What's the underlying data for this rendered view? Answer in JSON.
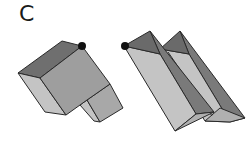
{
  "panel_label": "C",
  "colors": {
    "dark_face": "#6f6f6f",
    "mid_face": "#9e9e9e",
    "light_face": "#c4c4c4",
    "edge": "#2a2a2a",
    "marker": "#111111"
  },
  "figures": [
    {
      "name": "l-shaped-block",
      "description": "Folded L-shaped block with a black dot marking a corner"
    },
    {
      "name": "double-prism",
      "description": "Two parallel triangular prisms with a black dot marking a corner"
    }
  ]
}
